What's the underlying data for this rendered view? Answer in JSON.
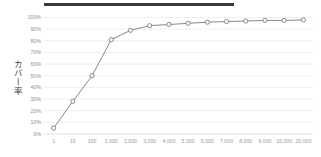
{
  "figure": {
    "title_redacted": true,
    "title_redaction_label": "redacted-title-bar"
  },
  "chart_data": {
    "type": "line",
    "title": "",
    "subtitle": "",
    "xlabel": "",
    "ylabel": "カバー率",
    "categories": [
      "1",
      "10",
      "100",
      "1,000",
      "2,000",
      "3,000",
      "4,000",
      "5,000",
      "6,000",
      "7,000",
      "8,000",
      "9,000",
      "10,000",
      "20,000"
    ],
    "values": [
      5,
      28,
      50,
      81,
      89,
      93,
      94,
      95,
      96,
      96.5,
      97,
      97.5,
      97.5,
      98
    ],
    "ylim": [
      0,
      100
    ],
    "yticks": [
      0,
      10,
      20,
      30,
      40,
      50,
      60,
      70,
      80,
      90,
      100
    ],
    "ytick_labels": [
      "0%",
      "10%",
      "20%",
      "30%",
      "40%",
      "50%",
      "60%",
      "70%",
      "80%",
      "90%",
      "100%"
    ],
    "y_unit": "%",
    "grid": true,
    "grid_axis": "y",
    "legend": false,
    "legend_position": "none",
    "series": [
      {
        "name": "カバー率",
        "values": [
          5,
          28,
          50,
          81,
          89,
          93,
          94,
          95,
          96,
          96.5,
          97,
          97.5,
          97.5,
          98
        ],
        "line_color": "#7b7b80",
        "marker": "circle-open",
        "marker_fill": "#ffffff",
        "marker_edge_color": "#6e6e73"
      }
    ],
    "colors": {
      "line": "#7b7b80",
      "marker_edge": "#6e6e73",
      "marker_fill": "#ffffff",
      "gridline": "#e6e6e6",
      "tick_text": "#939393",
      "axis_title": "#3f3f3f",
      "redaction_bar": "#3a3a3a",
      "background": "#ffffff"
    }
  }
}
